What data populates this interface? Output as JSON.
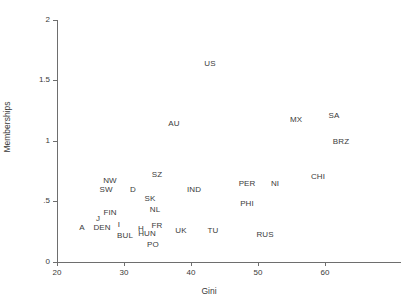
{
  "chart_data": {
    "type": "scatter",
    "title": "",
    "xlabel": "Gini",
    "ylabel": "Memberships",
    "xlim": [
      20,
      71
    ],
    "ylim": [
      0,
      2
    ],
    "xticks": [
      20,
      30,
      40,
      50,
      60
    ],
    "yticks": [
      "0",
      ".5",
      "1",
      "1.5",
      "2"
    ],
    "ytick_values": [
      0,
      0.5,
      1,
      1.5,
      2
    ],
    "grid": false,
    "legend": null,
    "marker_style": "text-label",
    "points": [
      {
        "label": "US",
        "x": 41.0,
        "y": 1.64
      },
      {
        "label": "SA",
        "x": 60.0,
        "y": 1.14
      },
      {
        "label": "MX",
        "x": 56.2,
        "y": 1.12
      },
      {
        "label": "AU",
        "x": 33.7,
        "y": 1.09
      },
      {
        "label": "BRZ",
        "x": 60.7,
        "y": 0.99
      },
      {
        "label": "CHI",
        "x": 57.5,
        "y": 0.69
      },
      {
        "label": "SZ",
        "x": 35.0,
        "y": 0.68
      },
      {
        "label": "NW",
        "x": 26.5,
        "y": 0.59
      },
      {
        "label": "PER",
        "x": 49.0,
        "y": 0.58
      },
      {
        "label": "NI",
        "x": 52.8,
        "y": 0.58
      },
      {
        "label": "SW",
        "x": 26.0,
        "y": 0.54
      },
      {
        "label": "D",
        "x": 30.5,
        "y": 0.54
      },
      {
        "label": "IND",
        "x": 40.5,
        "y": 0.54
      },
      {
        "label": "PHI",
        "x": 49.3,
        "y": 0.47
      },
      {
        "label": "SK",
        "x": 33.8,
        "y": 0.45
      },
      {
        "label": "PHI2",
        "x": 0,
        "y": 0
      },
      {
        "label": "NL",
        "x": 34.5,
        "y": 0.39
      },
      {
        "label": "FIN",
        "x": 25.5,
        "y": 0.3
      },
      {
        "label": "J",
        "x": 24.6,
        "y": 0.26
      },
      {
        "label": "FR",
        "x": 35.8,
        "y": 0.25
      },
      {
        "label": "UK",
        "x": 40.5,
        "y": 0.21
      },
      {
        "label": "TU",
        "x": 45.3,
        "y": 0.21
      },
      {
        "label": "A",
        "x": 22.7,
        "y": 0.2
      },
      {
        "label": "DEN",
        "x": 24.8,
        "y": 0.2
      },
      {
        "label": "I",
        "x": 27.0,
        "y": 0.22
      },
      {
        "label": "HUN",
        "x": 33.9,
        "y": 0.17
      },
      {
        "label": "H",
        "x": 32.6,
        "y": 0.2
      },
      {
        "label": "BUL",
        "x": 31.3,
        "y": 0.15
      },
      {
        "label": "RUS",
        "x": 50.0,
        "y": 0.16
      },
      {
        "label": "PO",
        "x": 34.7,
        "y": 0.08
      }
    ]
  },
  "axes": {
    "x": {
      "title": "Gini",
      "tick_labels": [
        "20",
        "30",
        "40",
        "50",
        "60"
      ]
    },
    "y": {
      "title": "Memberships",
      "tick_labels": [
        "0",
        ".5",
        "1",
        "1.5",
        "2"
      ]
    }
  },
  "markers": [
    {
      "name": "US",
      "text": "US",
      "left": 210,
      "top": 64
    },
    {
      "name": "SA",
      "text": "SA",
      "left": 334,
      "top": 116
    },
    {
      "name": "MX",
      "text": "MX",
      "left": 296,
      "top": 120
    },
    {
      "name": "AU",
      "text": "AU",
      "left": 174,
      "top": 124
    },
    {
      "name": "BRZ",
      "text": "BRZ",
      "left": 341,
      "top": 142
    },
    {
      "name": "CHI",
      "text": "CHI",
      "left": 318,
      "top": 177
    },
    {
      "name": "SZ",
      "text": "SZ",
      "left": 157,
      "top": 175
    },
    {
      "name": "NW",
      "text": "NW",
      "left": 110,
      "top": 181
    },
    {
      "name": "PER",
      "text": "PER",
      "left": 247,
      "top": 184
    },
    {
      "name": "NI",
      "text": "NI",
      "left": 275,
      "top": 184
    },
    {
      "name": "SW",
      "text": "SW",
      "left": 106,
      "top": 190
    },
    {
      "name": "D",
      "text": "D",
      "left": 133,
      "top": 190
    },
    {
      "name": "IND",
      "text": "IND",
      "left": 194,
      "top": 190
    },
    {
      "name": "PHI",
      "text": "PHI",
      "left": 247,
      "top": 204
    },
    {
      "name": "SK",
      "text": "SK",
      "left": 150,
      "top": 199
    },
    {
      "name": "NL",
      "text": "NL",
      "left": 155,
      "top": 210
    },
    {
      "name": "FIN",
      "text": "FIN",
      "left": 110,
      "top": 213
    },
    {
      "name": "J",
      "text": "J",
      "left": 98,
      "top": 219
    },
    {
      "name": "FR",
      "text": "FR",
      "left": 157,
      "top": 226
    },
    {
      "name": "UK",
      "text": "UK",
      "left": 181,
      "top": 231
    },
    {
      "name": "TU",
      "text": "TU",
      "left": 213,
      "top": 231
    },
    {
      "name": "A",
      "text": "A",
      "left": 82,
      "top": 228
    },
    {
      "name": "DEN",
      "text": "DEN",
      "left": 102,
      "top": 228
    },
    {
      "name": "I",
      "text": "I",
      "left": 119,
      "top": 225
    },
    {
      "name": "H",
      "text": "H",
      "left": 141,
      "top": 229
    },
    {
      "name": "HUN",
      "text": "HUN",
      "left": 147,
      "top": 234
    },
    {
      "name": "BUL",
      "text": "BUL",
      "left": 125,
      "top": 236
    },
    {
      "name": "RUS",
      "text": "RUS",
      "left": 265,
      "top": 235
    },
    {
      "name": "PO",
      "text": "PO",
      "left": 153,
      "top": 245
    }
  ],
  "xticks_px": [
    {
      "label": "20",
      "left": 57
    },
    {
      "label": "30",
      "left": 124
    },
    {
      "label": "40",
      "left": 191
    },
    {
      "label": "50",
      "left": 258
    },
    {
      "label": "60",
      "left": 325
    }
  ],
  "yticks_px": [
    {
      "label": "0",
      "top": 262
    },
    {
      "label": ".5",
      "top": 201
    },
    {
      "label": "1",
      "top": 141
    },
    {
      "label": "1.5",
      "top": 80
    },
    {
      "label": "2",
      "top": 20
    }
  ]
}
